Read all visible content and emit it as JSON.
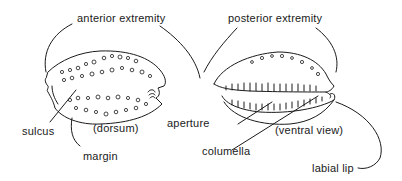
{
  "diagram": {
    "views": [
      {
        "id": "dorsum",
        "caption": "(dorsum)"
      },
      {
        "id": "ventral",
        "caption": "(ventral view)"
      }
    ],
    "labels": {
      "anterior_extremity": "anterior extremity",
      "posterior_extremity": "posterior extremity",
      "sulcus": "sulcus",
      "margin": "margin",
      "dorsum": "(dorsum)",
      "aperture": "aperture",
      "columella": "columella",
      "ventral_view": "(ventral view)",
      "labial_lip": "labial lip"
    },
    "colors": {
      "line": "#1a1a1a",
      "background": "#ffffff"
    }
  }
}
